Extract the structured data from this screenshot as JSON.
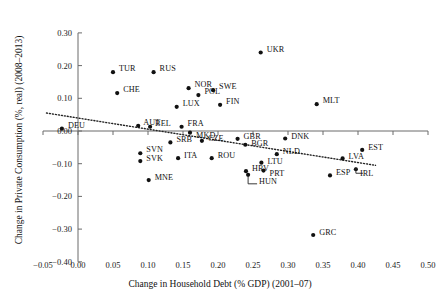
{
  "chart_data": {
    "type": "scatter",
    "title": "",
    "xlabel": "Change in Household Debt (% GDP) (2001–07)",
    "ylabel": "Change in Private Consumption (%, real) (2008–2013)",
    "xlim": [
      -0.05,
      0.5
    ],
    "ylim": [
      -0.4,
      0.3
    ],
    "xticks": [
      -0.05,
      0.0,
      0.05,
      0.1,
      0.15,
      0.2,
      0.25,
      0.3,
      0.35,
      0.4,
      0.45,
      0.5
    ],
    "xtick_labels": [
      "−0.05",
      "0.00",
      "0.05",
      "0.10",
      "0.15",
      "0.20",
      "0.25",
      "0.30",
      "0.35",
      "0.40",
      "0.45",
      "0.50"
    ],
    "yticks": [
      0.3,
      0.2,
      0.1,
      0.0,
      -0.1,
      -0.2,
      -0.3,
      -0.4
    ],
    "ytick_labels": [
      "0.30",
      "0.20",
      "0.10",
      "0.00",
      "−0.10",
      "−0.20",
      "−0.30",
      "−0.40"
    ],
    "grid": false,
    "legend": "none",
    "marker_color": "#111111",
    "axis_color": "#6b6b6b",
    "trendline": {
      "style": "dotted",
      "color": "#222222",
      "x_start": -0.045,
      "y_start": 0.055,
      "x_end": 0.425,
      "y_end": -0.105
    },
    "points": [
      {
        "label": "DEU",
        "x": -0.023,
        "y": 0.007,
        "lx": 6,
        "ly": -4
      },
      {
        "label": "TUR",
        "x": 0.05,
        "y": 0.18,
        "lx": 6,
        "ly": -4
      },
      {
        "label": "RUS",
        "x": 0.108,
        "y": 0.18,
        "lx": 6,
        "ly": -4
      },
      {
        "label": "CHE",
        "x": 0.056,
        "y": 0.116,
        "lx": 6,
        "ly": -4
      },
      {
        "label": "NOR",
        "x": 0.158,
        "y": 0.131,
        "lx": 6,
        "ly": -4
      },
      {
        "label": "SWE",
        "x": 0.193,
        "y": 0.125,
        "lx": 6,
        "ly": -4
      },
      {
        "label": "POL",
        "x": 0.172,
        "y": 0.11,
        "lx": 6,
        "ly": -4
      },
      {
        "label": "LUX",
        "x": 0.141,
        "y": 0.074,
        "lx": 6,
        "ly": -4
      },
      {
        "label": "FIN",
        "x": 0.203,
        "y": 0.08,
        "lx": 6,
        "ly": -4
      },
      {
        "label": "AUT",
        "x": 0.086,
        "y": 0.016,
        "lx": 5,
        "ly": -4
      },
      {
        "label": "BEL",
        "x": 0.103,
        "y": 0.013,
        "lx": 5,
        "ly": -4
      },
      {
        "label": "FRA",
        "x": 0.148,
        "y": 0.013,
        "lx": 6,
        "ly": -4
      },
      {
        "label": "MKD",
        "x": 0.16,
        "y": -0.005,
        "lx": 6,
        "ly": 2
      },
      {
        "label": "MLT",
        "x": 0.341,
        "y": 0.082,
        "lx": 6,
        "ly": -4
      },
      {
        "label": "SRB",
        "x": 0.132,
        "y": -0.035,
        "lx": 6,
        "ly": -3
      },
      {
        "label": "CZE",
        "x": 0.177,
        "y": -0.03,
        "lx": 6,
        "ly": -3
      },
      {
        "label": "GBR",
        "x": 0.228,
        "y": -0.024,
        "lx": 6,
        "ly": -3
      },
      {
        "label": "BGR",
        "x": 0.239,
        "y": -0.042,
        "lx": 6,
        "ly": -2
      },
      {
        "label": "DNK",
        "x": 0.296,
        "y": -0.023,
        "lx": 6,
        "ly": -3
      },
      {
        "label": "EST",
        "x": 0.406,
        "y": -0.058,
        "lx": 6,
        "ly": -3
      },
      {
        "label": "SVN",
        "x": 0.089,
        "y": -0.068,
        "lx": 6,
        "ly": -4
      },
      {
        "label": "SVK",
        "x": 0.089,
        "y": -0.092,
        "lx": 6,
        "ly": -3
      },
      {
        "label": "ITA",
        "x": 0.143,
        "y": -0.083,
        "lx": 6,
        "ly": -3
      },
      {
        "label": "ROU",
        "x": 0.191,
        "y": -0.083,
        "lx": 6,
        "ly": -3
      },
      {
        "label": "NLD",
        "x": 0.284,
        "y": -0.071,
        "lx": 6,
        "ly": -3
      },
      {
        "label": "LVA",
        "x": 0.378,
        "y": -0.084,
        "lx": 6,
        "ly": -2
      },
      {
        "label": "LTU",
        "x": 0.262,
        "y": -0.097,
        "lx": 6,
        "ly": -2
      },
      {
        "label": "IRL",
        "x": 0.397,
        "y": -0.117,
        "lx": 4,
        "ly": 4
      },
      {
        "label": "HRV",
        "x": 0.24,
        "y": -0.123,
        "lx": 6,
        "ly": -3
      },
      {
        "label": "HUN",
        "x": 0.243,
        "y": -0.134,
        "lx": 11,
        "ly": 6
      },
      {
        "label": "PRT",
        "x": 0.265,
        "y": -0.121,
        "lx": 6,
        "ly": 2
      },
      {
        "label": "ESP",
        "x": 0.36,
        "y": -0.136,
        "lx": 6,
        "ly": -3
      },
      {
        "label": "MNE",
        "x": 0.101,
        "y": -0.15,
        "lx": 6,
        "ly": -3
      },
      {
        "label": "UKR",
        "x": 0.261,
        "y": 0.24,
        "lx": 6,
        "ly": -4
      },
      {
        "label": "GRC",
        "x": 0.336,
        "y": -0.318,
        "lx": 6,
        "ly": -3
      }
    ]
  }
}
